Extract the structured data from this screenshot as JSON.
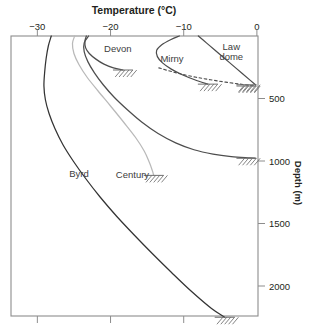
{
  "chart_data": {
    "type": "line",
    "title": "Temperature (°C)",
    "xlabel": "Temperature (°C)",
    "ylabel": "Depth (m)",
    "xlim": [
      -33.6,
      0.15
    ],
    "ylim": [
      0,
      2240
    ],
    "grid": false,
    "legend": "inline-labels",
    "x_ticks": [
      -30,
      -20,
      -10,
      0
    ],
    "x_tick_labels": [
      "−30",
      "−20",
      "−10",
      "0"
    ],
    "y_ticks": [
      500,
      1000,
      1500,
      2000
    ],
    "y_tick_labels": [
      "500",
      "1000",
      "1500",
      "2000"
    ],
    "series": [
      {
        "name": "Devon",
        "color": "#4d4d4d",
        "style": "solid",
        "terminator": "bedrock-hatch",
        "points": [
          [
            -23.3,
            0
          ],
          [
            -23.5,
            40
          ],
          [
            -23.4,
            95
          ],
          [
            -22.9,
            140
          ],
          [
            -22.0,
            185
          ],
          [
            -20.9,
            225
          ],
          [
            -19.6,
            255
          ],
          [
            -18.3,
            272
          ]
        ]
      },
      {
        "name": "Mirny",
        "color": "#4d4d4d",
        "style": "solid",
        "terminator": "bedrock-hatch",
        "points": [
          [
            -10.6,
            0
          ],
          [
            -11.8,
            30
          ],
          [
            -13.0,
            70
          ],
          [
            -13.7,
            115
          ],
          [
            -13.6,
            165
          ],
          [
            -12.9,
            215
          ],
          [
            -11.7,
            265
          ],
          [
            -10.2,
            310
          ],
          [
            -8.5,
            350
          ],
          [
            -6.7,
            385
          ]
        ]
      },
      {
        "name": "Law dome",
        "color": "#4d4d4d",
        "style": "solid-then-dashed",
        "terminator": "bedrock-hatch",
        "points": [
          [
            -8.0,
            0
          ],
          [
            -6.9,
            55
          ],
          [
            -5.8,
            110
          ],
          [
            -4.6,
            170
          ],
          [
            -3.3,
            235
          ],
          [
            -2.0,
            300
          ],
          [
            -0.9,
            355
          ],
          [
            -0.2,
            390
          ]
        ],
        "dashed_points": [
          [
            -13.4,
            255
          ],
          [
            -11.0,
            295
          ],
          [
            -8.3,
            330
          ],
          [
            -5.3,
            360
          ],
          [
            -2.3,
            385
          ],
          [
            -0.2,
            400
          ]
        ]
      },
      {
        "name": "Century",
        "color": "#b9b9b9",
        "style": "solid",
        "terminator": "bedrock-hatch",
        "points": [
          [
            -24.9,
            0
          ],
          [
            -25.2,
            60
          ],
          [
            -25.0,
            140
          ],
          [
            -24.3,
            230
          ],
          [
            -23.2,
            330
          ],
          [
            -21.7,
            440
          ],
          [
            -20.0,
            560
          ],
          [
            -18.2,
            690
          ],
          [
            -16.6,
            810
          ],
          [
            -15.4,
            920
          ],
          [
            -14.7,
            1010
          ],
          [
            -14.3,
            1075
          ],
          [
            -14.1,
            1115
          ]
        ]
      },
      {
        "name": "Byrd",
        "color": "#333333",
        "style": "solid",
        "terminator": "bedrock-hatch",
        "points": [
          [
            -28.1,
            0
          ],
          [
            -28.5,
            80
          ],
          [
            -28.8,
            180
          ],
          [
            -29.0,
            290
          ],
          [
            -29.1,
            400
          ],
          [
            -28.9,
            510
          ],
          [
            -28.4,
            620
          ],
          [
            -27.6,
            740
          ],
          [
            -26.5,
            870
          ],
          [
            -25.1,
            1000
          ],
          [
            -23.4,
            1140
          ],
          [
            -21.4,
            1290
          ],
          [
            -19.2,
            1440
          ],
          [
            -16.8,
            1590
          ],
          [
            -14.3,
            1740
          ],
          [
            -11.7,
            1890
          ],
          [
            -9.0,
            2040
          ],
          [
            -6.2,
            2180
          ],
          [
            -4.4,
            2250
          ]
        ]
      },
      {
        "name": "unlabeled-profile",
        "color": "#4d4d4d",
        "style": "solid",
        "terminator": "bedrock-hatch",
        "points": [
          [
            -23.0,
            0
          ],
          [
            -23.6,
            55
          ],
          [
            -23.6,
            125
          ],
          [
            -23.1,
            205
          ],
          [
            -22.2,
            295
          ],
          [
            -21.0,
            390
          ],
          [
            -19.5,
            490
          ],
          [
            -17.7,
            590
          ],
          [
            -15.7,
            690
          ],
          [
            -13.5,
            780
          ],
          [
            -11.1,
            855
          ],
          [
            -8.6,
            910
          ],
          [
            -6.0,
            945
          ],
          [
            -3.5,
            965
          ],
          [
            -1.0,
            975
          ],
          [
            -0.2,
            978
          ]
        ]
      }
    ],
    "annotations": [
      {
        "text": "Devon",
        "x": -19.0,
        "y": 130
      },
      {
        "text": "Mirny",
        "x": -11.6,
        "y": 205
      },
      {
        "text": "Law",
        "x": -3.5,
        "y": 115
      },
      {
        "text": "dome",
        "x": -3.5,
        "y": 190
      },
      {
        "text": "Byrd",
        "x": -24.3,
        "y": 1125
      },
      {
        "text": "Century",
        "x": -17.0,
        "y": 1135
      }
    ]
  }
}
